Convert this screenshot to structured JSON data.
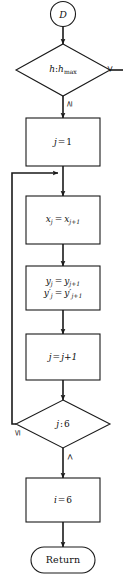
{
  "diagram": {
    "type": "flowchart",
    "title": "",
    "nodes": [
      {
        "id": "start",
        "shape": "circle",
        "label": "D"
      },
      {
        "id": "dec1",
        "shape": "diamond",
        "label": "h : h_max",
        "lhs": "h",
        "sep": ":",
        "rhs": "h",
        "rhs_sub": "max"
      },
      {
        "id": "proc1",
        "shape": "rectangle",
        "label": "j = 1"
      },
      {
        "id": "proc2",
        "shape": "rectangle",
        "label": "x_j = x_{j+1}"
      },
      {
        "id": "proc3",
        "shape": "rectangle",
        "label": "y_j = y_{j+1} ; y'_j = y'_{j+1}"
      },
      {
        "id": "proc4",
        "shape": "rectangle",
        "label": "j = j + 1"
      },
      {
        "id": "dec2",
        "shape": "diamond",
        "label": "j : 6"
      },
      {
        "id": "proc5",
        "shape": "rectangle",
        "label": "i = 6"
      },
      {
        "id": "return",
        "shape": "terminator",
        "label": "Return"
      }
    ],
    "edge_labels": {
      "dec1_right": "<",
      "dec1_down": "≥",
      "dec2_left": "≤",
      "dec2_down": ">"
    },
    "text": {
      "start_label": "D",
      "dec1_lhs": "h",
      "dec1_colon": ":",
      "dec1_rhs": "h",
      "dec1_rhs_sub": "max",
      "proc1_lhs": "j",
      "proc1_eq": "=",
      "proc1_rhs": "1",
      "proc2_lhs": "x",
      "proc2_lhs_sub": "j",
      "proc2_eq": "=",
      "proc2_rhs": "x",
      "proc2_rhs_sub": "j+1",
      "proc3_line1_lhs": "y",
      "proc3_line1_lhs_sub": "j",
      "proc3_line1_eq": "=",
      "proc3_line1_rhs": "y",
      "proc3_line1_rhs_sub": "j+1",
      "proc3_line2_lhs": "y′",
      "proc3_line2_lhs_sub": "j",
      "proc3_line2_eq": "=",
      "proc3_line2_rhs": "y′",
      "proc3_line2_rhs_sub": "j+1",
      "proc4_lhs": "j",
      "proc4_eq": "=",
      "proc4_rhs": "j+1",
      "dec2_lhs": "j",
      "dec2_colon": ":",
      "dec2_rhs": "6",
      "proc5_lhs": "i",
      "proc5_eq": "=",
      "proc5_rhs": "6",
      "return_label": "Return"
    },
    "colors": {
      "stroke": "#1a1a1a",
      "text": "#111111",
      "background": "#ffffff"
    }
  }
}
